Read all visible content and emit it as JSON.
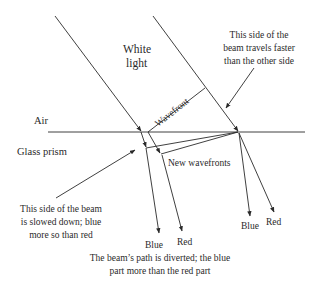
{
  "labels": {
    "white_light_line1": "White",
    "white_light_line2": "light",
    "air": "Air",
    "glass_prism": "Glass prism",
    "wavefront": "Wavefront",
    "new_wavefronts": "New wavefronts",
    "fast_side_line1": "This side of the",
    "fast_side_line2": "beam travels faster",
    "fast_side_line3": "than the other side",
    "slow_side_line1": "This side of the beam",
    "slow_side_line2": "is slowed down; blue",
    "slow_side_line3": "more so than red",
    "left_blue": "Blue",
    "left_red": "Red",
    "right_blue": "Blue",
    "right_red": "Red",
    "caption_line1": "The beam’s path is diverted; the blue",
    "caption_line2": "part more than the red part"
  },
  "colors": {
    "line": "#2a2a2a",
    "background": "#ffffff"
  }
}
